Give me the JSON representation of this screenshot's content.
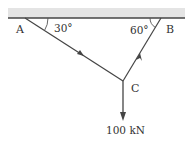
{
  "diagram": {
    "type": "statics-free-body",
    "points": {
      "A": {
        "label": "A",
        "x": 25,
        "y": 18
      },
      "B": {
        "label": "B",
        "x": 161,
        "y": 18
      },
      "C": {
        "label": "C",
        "x": 123,
        "y": 81
      }
    },
    "angles": {
      "at_A": "30°",
      "at_B": "60°"
    },
    "load": {
      "label": "100 kN",
      "direction": "down"
    },
    "colors": {
      "line": "#444444",
      "ceiling_fill": "#e4e4e4",
      "text": "#333333"
    }
  }
}
